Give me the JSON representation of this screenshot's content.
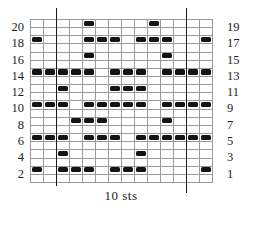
{
  "chart_data": {
    "type": "heatmap",
    "title": "",
    "xlabel": "10 sts",
    "ylabel": "",
    "grid": true,
    "legend_position": "none",
    "columns": 14,
    "rows": 20,
    "cell_states": [
      "empty",
      "filled"
    ],
    "row_numbers_left": [
      20,
      18,
      16,
      14,
      12,
      10,
      8,
      6,
      4,
      2
    ],
    "row_numbers_right": [
      19,
      17,
      15,
      13,
      11,
      9,
      7,
      5,
      3,
      1
    ],
    "repeat_span_columns": [
      3,
      12
    ],
    "repeat_label": "10 sts",
    "colors": {
      "filled": "#141414",
      "empty": "#ffffff",
      "gridline": "#9a9a9a",
      "marker": "#1a1a1a"
    },
    "matrix_top_to_bottom": [
      [
        0,
        0,
        0,
        0,
        1,
        0,
        0,
        0,
        0,
        1,
        0,
        0,
        0,
        0
      ],
      [
        0,
        0,
        0,
        0,
        0,
        0,
        0,
        0,
        0,
        0,
        0,
        0,
        0,
        0
      ],
      [
        1,
        0,
        0,
        0,
        1,
        1,
        1,
        0,
        1,
        1,
        1,
        0,
        0,
        1
      ],
      [
        0,
        0,
        0,
        0,
        0,
        0,
        0,
        0,
        0,
        0,
        0,
        0,
        0,
        0
      ],
      [
        0,
        0,
        0,
        0,
        1,
        0,
        0,
        0,
        0,
        0,
        1,
        0,
        0,
        0
      ],
      [
        0,
        0,
        0,
        0,
        0,
        0,
        0,
        0,
        0,
        0,
        0,
        0,
        0,
        0
      ],
      [
        1,
        1,
        1,
        1,
        1,
        0,
        1,
        1,
        1,
        0,
        1,
        1,
        1,
        1
      ],
      [
        0,
        0,
        0,
        0,
        0,
        0,
        0,
        0,
        0,
        0,
        0,
        0,
        0,
        0
      ],
      [
        0,
        0,
        1,
        0,
        0,
        0,
        1,
        1,
        1,
        0,
        0,
        0,
        0,
        0
      ],
      [
        0,
        0,
        0,
        0,
        0,
        0,
        0,
        0,
        0,
        0,
        0,
        0,
        0,
        0
      ],
      [
        1,
        1,
        1,
        0,
        1,
        1,
        1,
        1,
        1,
        0,
        1,
        1,
        1,
        1
      ],
      [
        0,
        0,
        0,
        0,
        0,
        0,
        0,
        0,
        0,
        0,
        0,
        0,
        0,
        0
      ],
      [
        0,
        0,
        0,
        1,
        1,
        1,
        0,
        0,
        0,
        0,
        1,
        0,
        0,
        0
      ],
      [
        0,
        0,
        0,
        0,
        0,
        0,
        0,
        0,
        0,
        0,
        0,
        0,
        0,
        0
      ],
      [
        1,
        1,
        1,
        0,
        1,
        1,
        1,
        0,
        1,
        1,
        1,
        1,
        1,
        1
      ],
      [
        0,
        0,
        0,
        0,
        0,
        0,
        0,
        0,
        0,
        0,
        0,
        0,
        0,
        0
      ],
      [
        0,
        0,
        1,
        0,
        0,
        0,
        0,
        0,
        1,
        0,
        0,
        0,
        0,
        0
      ],
      [
        0,
        0,
        0,
        0,
        0,
        0,
        0,
        0,
        0,
        0,
        0,
        0,
        0,
        0
      ],
      [
        1,
        0,
        1,
        1,
        1,
        0,
        1,
        1,
        1,
        0,
        0,
        0,
        0,
        1
      ],
      [
        0,
        0,
        0,
        0,
        0,
        0,
        0,
        0,
        0,
        0,
        0,
        0,
        0,
        0
      ]
    ],
    "row_data_by_number": [
      {
        "row": 19,
        "filled_columns": [
          5,
          10
        ]
      },
      {
        "row": 17,
        "filled_columns": [
          1,
          5,
          6,
          7,
          9,
          10,
          11,
          14
        ]
      },
      {
        "row": 15,
        "filled_columns": [
          5,
          11
        ]
      },
      {
        "row": 13,
        "filled_columns": [
          1,
          2,
          3,
          4,
          5,
          7,
          8,
          9,
          11,
          12,
          13,
          14
        ]
      },
      {
        "row": 11,
        "filled_columns": [
          3,
          7,
          8,
          9
        ]
      },
      {
        "row": 9,
        "filled_columns": [
          1,
          2,
          3,
          5,
          6,
          7,
          8,
          9,
          11,
          12,
          13,
          14
        ]
      },
      {
        "row": 7,
        "filled_columns": [
          4,
          5,
          6,
          11
        ]
      },
      {
        "row": 5,
        "filled_columns": [
          1,
          2,
          3,
          5,
          6,
          7,
          9,
          10,
          11,
          12,
          13,
          14
        ]
      },
      {
        "row": 3,
        "filled_columns": [
          3,
          9
        ]
      },
      {
        "row": 1,
        "filled_columns": [
          1,
          3,
          4,
          5,
          7,
          8,
          9,
          14
        ]
      }
    ]
  }
}
